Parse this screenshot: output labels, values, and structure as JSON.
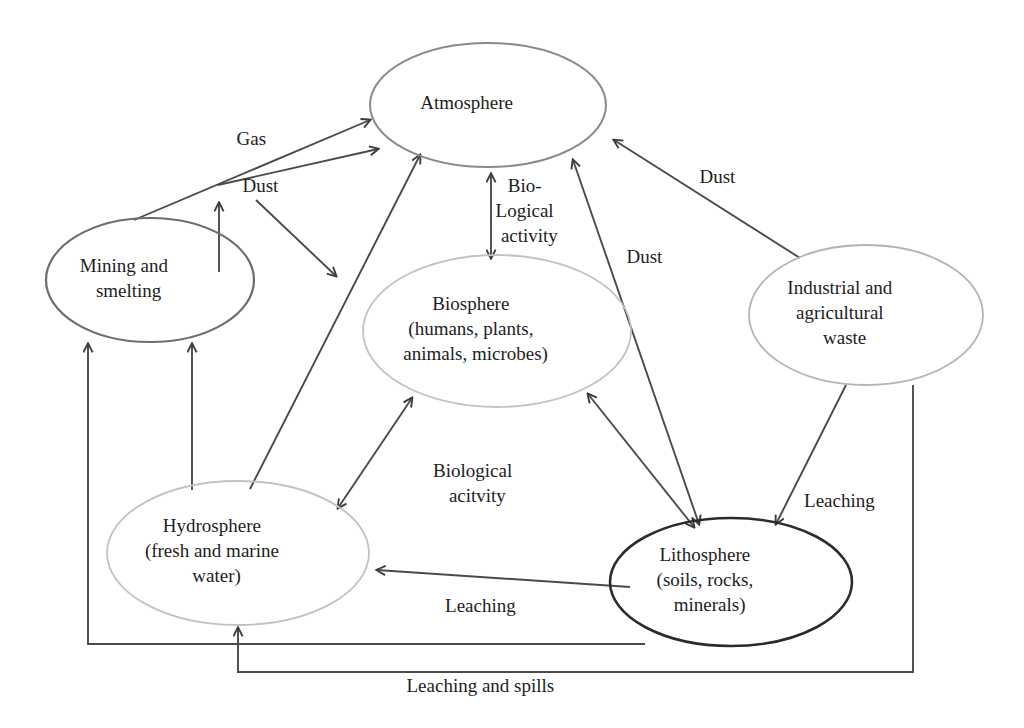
{
  "diagram": {
    "background_color": "#ffffff",
    "edge_color": "#4a4a4a",
    "nodes": [
      {
        "id": "atmosphere",
        "label_lines": [
          "Atmosphere"
        ],
        "cx": 488,
        "cy": 105,
        "rx": 118,
        "ry": 62,
        "stroke": "#8a8a8a",
        "stroke_width": 2.0
      },
      {
        "id": "mining",
        "label_lines": [
          "Mining and",
          "smelting"
        ],
        "cx": 150,
        "cy": 280,
        "rx": 104,
        "ry": 62,
        "stroke": "#6e6e6e",
        "stroke_width": 2.2
      },
      {
        "id": "biosphere",
        "label_lines": [
          "Biosphere",
          "(humans, plants,",
          "animals, microbes)"
        ],
        "cx": 497,
        "cy": 331,
        "rx": 134,
        "ry": 76,
        "stroke": "#c2c2c2",
        "stroke_width": 1.8
      },
      {
        "id": "industrial",
        "label_lines": [
          "Industrial and",
          "agricultural",
          "waste"
        ],
        "cx": 866,
        "cy": 315,
        "rx": 117,
        "ry": 70,
        "stroke": "#b4b4b4",
        "stroke_width": 1.8
      },
      {
        "id": "hydrosphere",
        "label_lines": [
          "Hydrosphere",
          "(fresh and marine",
          "water)"
        ],
        "cx": 238,
        "cy": 553,
        "rx": 131,
        "ry": 72,
        "stroke": "#c2c2c2",
        "stroke_width": 1.8
      },
      {
        "id": "lithosphere",
        "label_lines": [
          "Lithosphere",
          "(soils, rocks,",
          "minerals)"
        ],
        "cx": 731,
        "cy": 582,
        "rx": 121,
        "ry": 64,
        "stroke": "#2b2b2b",
        "stroke_width": 2.6
      }
    ],
    "edge_labels": [
      {
        "id": "gas",
        "lines": [
          "Gas"
        ],
        "x": 268,
        "y": 141
      },
      {
        "id": "dust-mining",
        "lines": [
          "Dust"
        ],
        "x": 277,
        "y": 188
      },
      {
        "id": "biological-activity",
        "lines": [
          "Bio-",
          "Logical",
          "activity"
        ],
        "x": 546,
        "y": 188
      },
      {
        "id": "dust-industrial",
        "lines": [
          "Dust"
        ],
        "x": 734,
        "y": 179
      },
      {
        "id": "dust-lithosphere",
        "lines": [
          "Dust"
        ],
        "x": 661,
        "y": 259
      },
      {
        "id": "biological-acitvity",
        "lines": [
          "Biological",
          "acitvity"
        ],
        "x": 494,
        "y": 473
      },
      {
        "id": "leaching-right",
        "lines": [
          "Leaching"
        ],
        "x": 856,
        "y": 503
      },
      {
        "id": "leaching-bottom",
        "lines": [
          "Leaching"
        ],
        "x": 497,
        "y": 608
      },
      {
        "id": "leaching-and-spills",
        "lines": [
          "Leaching and spills"
        ],
        "x": 497,
        "y": 688
      }
    ],
    "edges": [
      {
        "id": "mining-gas-to-atmosphere",
        "from": "mining",
        "to": "atmosphere",
        "label": "Gas",
        "arrows": "end"
      },
      {
        "id": "mining-dust-to-atmosphere",
        "from": "mining",
        "to": "atmosphere",
        "label": "Dust",
        "arrows": "end"
      },
      {
        "id": "mining-dust-vertical",
        "from": "mining",
        "to": "atmosphere",
        "label": "Dust",
        "arrows": "end"
      },
      {
        "id": "atmosphere-dust-to-hydrosphere",
        "from": "atmosphere",
        "to": "hydrosphere",
        "label": "Dust",
        "arrows": "end"
      },
      {
        "id": "hydrosphere-to-atmosphere",
        "from": "hydrosphere",
        "to": "atmosphere",
        "label": "",
        "arrows": "end"
      },
      {
        "id": "atmosphere-biosphere",
        "from": "atmosphere",
        "to": "biosphere",
        "label": "Biological activity",
        "arrows": "both"
      },
      {
        "id": "lithosphere-dust-to-atmosphere",
        "from": "lithosphere",
        "to": "atmosphere",
        "label": "Dust",
        "arrows": "both"
      },
      {
        "id": "industrial-dust-to-atmosphere",
        "from": "industrial",
        "to": "atmosphere",
        "label": "Dust",
        "arrows": "end"
      },
      {
        "id": "biosphere-hydrosphere",
        "from": "biosphere",
        "to": "hydrosphere",
        "label": "Biological acitvity",
        "arrows": "both"
      },
      {
        "id": "biosphere-lithosphere",
        "from": "biosphere",
        "to": "lithosphere",
        "label": "Biological acitvity",
        "arrows": "both"
      },
      {
        "id": "industrial-leaching-lithosphere",
        "from": "industrial",
        "to": "lithosphere",
        "label": "Leaching",
        "arrows": "end"
      },
      {
        "id": "lithosphere-leaching-hydrosphere",
        "from": "lithosphere",
        "to": "hydrosphere",
        "label": "Leaching",
        "arrows": "end"
      },
      {
        "id": "hydrosphere-to-mining",
        "from": "hydrosphere",
        "to": "mining",
        "label": "",
        "arrows": "end"
      },
      {
        "id": "lithosphere-spills-to-mining",
        "from": "lithosphere",
        "to": "mining",
        "label": "Leaching and spills",
        "arrows": "end"
      },
      {
        "id": "industrial-spills-to-hydrosphere",
        "from": "industrial",
        "to": "hydrosphere",
        "label": "Leaching and spills",
        "arrows": "end"
      }
    ]
  }
}
